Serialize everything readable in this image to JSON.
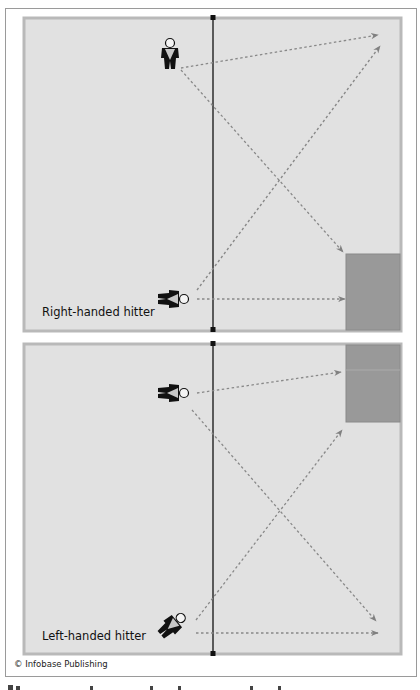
{
  "diagram": {
    "colors": {
      "court": "#e1e1e1",
      "court_border": "#b9b9b9",
      "target_zone": "#999999",
      "net": "#111111",
      "arrow": "#888888",
      "player": "#111111",
      "player_accent": "#c8c8c8"
    },
    "panels": [
      {
        "label": "Right-handed hitter",
        "court": {
          "x": 24,
          "y": 18,
          "w": 377,
          "h": 313
        },
        "target_zone": {
          "x": 346,
          "y": 254,
          "w": 54,
          "h": 77
        },
        "players": [
          {
            "id": "front-player",
            "orientation": "facing-viewer",
            "x": 170,
            "y": 55
          },
          {
            "id": "back-player",
            "orientation": "facing-right",
            "x": 170,
            "y": 299
          }
        ],
        "arrows": [
          {
            "from": [
              181,
              68
            ],
            "to": [
              378,
              35
            ]
          },
          {
            "from": [
              181,
              70
            ],
            "to": [
              343,
              252
            ]
          },
          {
            "from": [
              197,
              290
            ],
            "to": [
              380,
              46
            ]
          },
          {
            "from": [
              197,
              299
            ],
            "to": [
              345,
              299
            ]
          }
        ]
      },
      {
        "label": "Left-handed hitter",
        "court": {
          "x": 24,
          "y": 344,
          "w": 377,
          "h": 310
        },
        "target_zone": {
          "x": 346,
          "y": 344,
          "w": 54,
          "h": 78
        },
        "players": [
          {
            "id": "front-player",
            "orientation": "facing-right",
            "x": 170,
            "y": 393
          },
          {
            "id": "back-player",
            "orientation": "diagonal",
            "x": 172,
            "y": 624
          }
        ],
        "arrows": [
          {
            "from": [
              197,
              393
            ],
            "to": [
              341,
              372
            ]
          },
          {
            "from": [
              192,
              410
            ],
            "to": [
              376,
              621
            ]
          },
          {
            "from": [
              196,
              620
            ],
            "to": [
              342,
              430
            ]
          },
          {
            "from": [
              196,
              633
            ],
            "to": [
              378,
              633
            ]
          }
        ]
      }
    ],
    "net_x": 213,
    "credit": "© Infobase Publishing"
  }
}
